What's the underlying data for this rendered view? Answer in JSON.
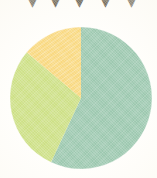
{
  "figure": {
    "width": 157,
    "height": 178,
    "background_color": "#fffefb"
  },
  "top_glyphs": {
    "description": "cropped-off dark glyph fragments along the top edge",
    "color": "#4a4230",
    "items": [
      {
        "char": "▼",
        "x": 24
      },
      {
        "char": "▼",
        "x": 47
      },
      {
        "char": "▼",
        "x": 71
      },
      {
        "char": "▼",
        "x": 97
      },
      {
        "char": "▼",
        "x": 123
      }
    ]
  },
  "chart_data": {
    "type": "pie",
    "title": "",
    "subtitle": "",
    "xlabel": "",
    "ylabel": "",
    "grid": false,
    "legend_position": "none",
    "start_angle_deg": 0,
    "direction": "clockwise",
    "center_x": 81,
    "center_y": 98,
    "radius": 71,
    "labels": [
      "Segment 1",
      "Segment 2",
      "Segment 3"
    ],
    "values": [
      57,
      29,
      14
    ],
    "units": "percent",
    "colors": [
      "#9cc8af",
      "#cde085",
      "#f9d87e"
    ],
    "slices": [
      {
        "label": "Segment 1",
        "value": 57,
        "percent": "57%",
        "color": "#9cc8af",
        "start_deg": 0,
        "end_deg": 205
      },
      {
        "label": "Segment 2",
        "value": 29,
        "percent": "29%",
        "color": "#cde085",
        "start_deg": 205,
        "end_deg": 310
      },
      {
        "label": "Segment 3",
        "value": 14,
        "percent": "14%",
        "color": "#f9d87e",
        "start_deg": 310,
        "end_deg": 360
      }
    ],
    "annotations": []
  }
}
